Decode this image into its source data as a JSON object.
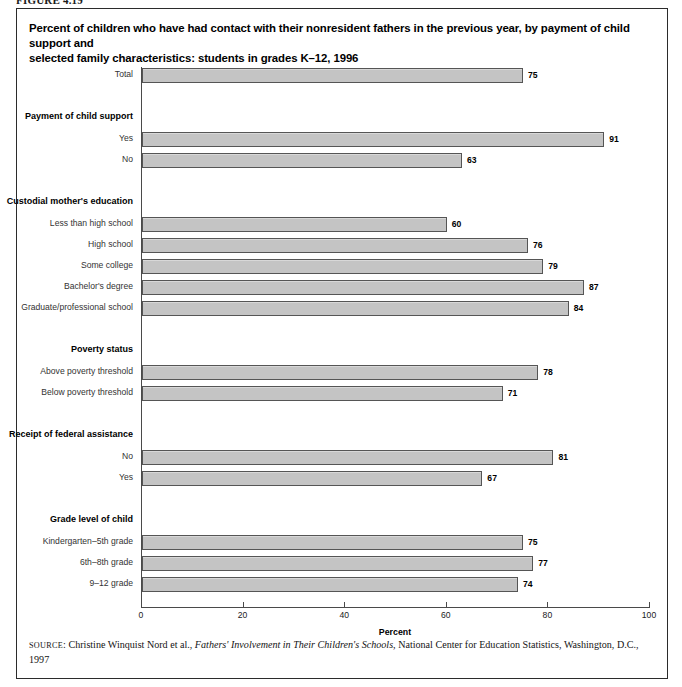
{
  "figure": {
    "number_label": "FIGURE 4.19"
  },
  "title": {
    "line1": "Percent of children who have had contact with their nonresident fathers in the previous year, by payment of child support and",
    "line2": "selected family characteristics: students in grades K–12, 1996"
  },
  "axis": {
    "x_title": "Percent",
    "ticks": [
      "0",
      "20",
      "40",
      "60",
      "80",
      "100"
    ]
  },
  "source": {
    "prefix": "SOURCE",
    "colon": ": ",
    "author": "Christine Winquist Nord et al., ",
    "work_italic": "Fathers' Involvement in Their Children's Schools,",
    "publisher": " National Center for Education Statistics, Washington, D.C.,",
    "year": "1997"
  },
  "chart_data": {
    "type": "bar",
    "orientation": "horizontal",
    "title": "Percent of children who have had contact with their nonresident fathers in the previous year, by payment of child support and selected family characteristics: students in grades K–12, 1996",
    "xlabel": "Percent",
    "ylabel": "",
    "xlim": [
      0,
      100
    ],
    "xticks": [
      0,
      20,
      40,
      60,
      80,
      100
    ],
    "grid": false,
    "legend": null,
    "bar_color": "#c4c4c4",
    "bar_edge_color": "#555555",
    "rows": [
      {
        "label": "Total",
        "value": 75,
        "kind": "bar"
      },
      {
        "label": "",
        "value": null,
        "kind": "spacer"
      },
      {
        "label": "Payment of child support",
        "value": null,
        "kind": "group"
      },
      {
        "label": "Yes",
        "value": 91,
        "kind": "bar"
      },
      {
        "label": "No",
        "value": 63,
        "kind": "bar"
      },
      {
        "label": "",
        "value": null,
        "kind": "spacer"
      },
      {
        "label": "Custodial mother's education",
        "value": null,
        "kind": "group"
      },
      {
        "label": "Less than high school",
        "value": 60,
        "kind": "bar"
      },
      {
        "label": "High school",
        "value": 76,
        "kind": "bar"
      },
      {
        "label": "Some college",
        "value": 79,
        "kind": "bar"
      },
      {
        "label": "Bachelor's degree",
        "value": 87,
        "kind": "bar"
      },
      {
        "label": "Graduate/professional school",
        "value": 84,
        "kind": "bar"
      },
      {
        "label": "",
        "value": null,
        "kind": "spacer"
      },
      {
        "label": "Poverty status",
        "value": null,
        "kind": "group"
      },
      {
        "label": "Above poverty threshold",
        "value": 78,
        "kind": "bar"
      },
      {
        "label": "Below poverty threshold",
        "value": 71,
        "kind": "bar"
      },
      {
        "label": "",
        "value": null,
        "kind": "spacer"
      },
      {
        "label": "Receipt of federal assistance",
        "value": null,
        "kind": "group"
      },
      {
        "label": "No",
        "value": 81,
        "kind": "bar"
      },
      {
        "label": "Yes",
        "value": 67,
        "kind": "bar"
      },
      {
        "label": "",
        "value": null,
        "kind": "spacer"
      },
      {
        "label": "Grade level of child",
        "value": null,
        "kind": "group"
      },
      {
        "label": "Kindergarten–5th grade",
        "value": 75,
        "kind": "bar"
      },
      {
        "label": "6th–8th grade",
        "value": 77,
        "kind": "bar"
      },
      {
        "label": "9–12 grade",
        "value": 74,
        "kind": "bar"
      }
    ],
    "categories": [
      "Total",
      "Yes",
      "No",
      "Less than high school",
      "High school",
      "Some college",
      "Bachelor's degree",
      "Graduate/professional school",
      "Above poverty threshold",
      "Below poverty threshold",
      "No",
      "Yes",
      "Kindergarten–5th grade",
      "6th–8th grade",
      "9–12 grade"
    ],
    "values": [
      75,
      91,
      63,
      60,
      76,
      79,
      87,
      84,
      78,
      71,
      81,
      67,
      75,
      77,
      74
    ],
    "groups": [
      "Payment of child support",
      "Custodial mother's education",
      "Poverty status",
      "Receipt of federal assistance",
      "Grade level of child"
    ]
  }
}
